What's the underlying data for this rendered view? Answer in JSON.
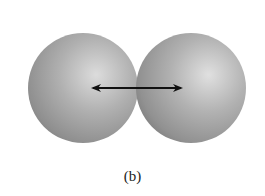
{
  "figure": {
    "caption": "(b)",
    "colors": {
      "sphere_highlight": "#d9d9d9",
      "sphere_mid": "#a6a6a6",
      "sphere_shadow": "#7a7a7a",
      "arrow": "#111111",
      "background": "#ffffff"
    },
    "atoms": [
      {
        "name": "left-atom",
        "cx": 83,
        "cy": 88,
        "r": 55
      },
      {
        "name": "right-atom",
        "cx": 191,
        "cy": 88,
        "r": 55
      }
    ],
    "arrow": {
      "x1": 91,
      "x2": 183,
      "y": 88,
      "heads": "both"
    }
  }
}
